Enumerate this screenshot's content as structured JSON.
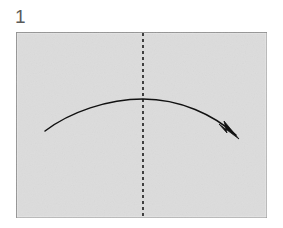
{
  "diagram": {
    "type": "origami-fold-instruction",
    "step_label": "1",
    "canvas": {
      "width": 283,
      "height": 228,
      "background": "#ffffff"
    },
    "paper": {
      "name": "paper-sheet",
      "shape": "rectangle",
      "x": 16,
      "y": 32,
      "width": 251,
      "height": 186,
      "fill_color": "#dcdcdc",
      "stroke_color": "#8c8c8c",
      "stroke_width": 1.4
    },
    "crease_line": {
      "name": "vertical-crease-line",
      "style": "dashed",
      "orientation": "vertical",
      "x": 143,
      "y1": 32,
      "y2": 218,
      "color": "#1a1a1a",
      "stroke_width": 1.6,
      "dash_pattern": "3 3"
    },
    "fold_arrow": {
      "name": "fold-arrow",
      "style": "curved-valley-fold",
      "color": "#111111",
      "stroke_width": 1.5,
      "start_x": 45,
      "start_y": 131,
      "apex_x": 143,
      "apex_y": 99,
      "end_x": 236,
      "end_y": 135,
      "path": "M 45 131 C 70 112, 108 99, 143 99 C 180 99, 214 115, 236 135",
      "arrowhead": {
        "name": "arrowhead",
        "tip_x": 239,
        "tip_y": 139,
        "style": "solid-filled-triangle",
        "points": "239,139 219,124 227,133 224,121"
      }
    }
  }
}
